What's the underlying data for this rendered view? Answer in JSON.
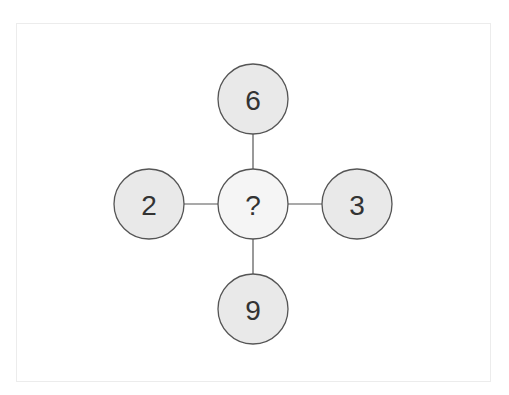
{
  "puzzle": {
    "center": {
      "label": "?",
      "cx": 253,
      "cy": 204,
      "r": 35,
      "fill": "#f5f5f5"
    },
    "nodes": [
      {
        "position": "top",
        "label": "6",
        "cx": 253,
        "cy": 99,
        "r": 35,
        "fill": "#e9e9e9"
      },
      {
        "position": "left",
        "label": "2",
        "cx": 149,
        "cy": 204,
        "r": 35,
        "fill": "#e9e9e9"
      },
      {
        "position": "right",
        "label": "3",
        "cx": 357,
        "cy": 204,
        "r": 35,
        "fill": "#e9e9e9"
      },
      {
        "position": "bottom",
        "label": "9",
        "cx": 253,
        "cy": 309,
        "r": 35,
        "fill": "#e9e9e9"
      }
    ],
    "stroke_color": "#555555",
    "text_color": "#333333"
  }
}
